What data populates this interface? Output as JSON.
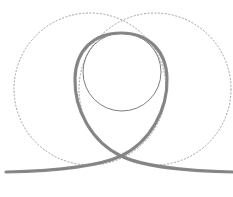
{
  "diagram": {
    "colors": {
      "background": "#ffffff",
      "loop_stroke": "#8c8c8c",
      "dashed_circle_stroke": "#8a8a8a",
      "inner_circle_stroke": "#6e6e6e"
    },
    "dashed_circles": [
      {
        "name": "left",
        "cx": 90,
        "cy": 89,
        "r": 76
      },
      {
        "name": "right",
        "cx": 155,
        "cy": 89,
        "r": 76
      }
    ],
    "inner_circle": {
      "cx": 122,
      "cy": 72,
      "r": 39
    },
    "loop": {
      "top_y": 33,
      "left_x": 75,
      "right_x": 167,
      "crossing": [
        121,
        156
      ],
      "tail_left": [
        6,
        172
      ],
      "tail_right": [
        233,
        172
      ]
    }
  }
}
